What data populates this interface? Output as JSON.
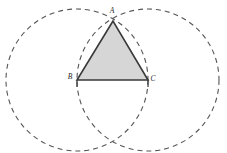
{
  "figure": {
    "type": "geometric-construction",
    "canvas": {
      "width": 227,
      "height": 153,
      "background": "#ffffff"
    },
    "style": {
      "triangle_fill": "#d6d6d6",
      "triangle_stroke": "#3a3a3a",
      "triangle_stroke_width": 1.6,
      "circle_stroke": "#555555",
      "circle_stroke_width": 1.1,
      "circle_dash": "5 4",
      "label_color": "#2b2b2b"
    },
    "points": [
      {
        "id": "A",
        "label": "A",
        "x": 113,
        "y": 21,
        "label_x": 112,
        "label_y": 13
      },
      {
        "id": "B",
        "label": "B",
        "x": 77,
        "y": 80,
        "label_x": 70,
        "label_y": 79
      },
      {
        "id": "C",
        "label": "C",
        "x": 148,
        "y": 80,
        "label_x": 153,
        "label_y": 81
      }
    ],
    "triangle": {
      "name": "triangle-ABC",
      "vertices": "113,21 77,80 148,80"
    },
    "circles": [
      {
        "id": "circle-B",
        "center": "B",
        "cx": 77,
        "cy": 80,
        "r": 71
      },
      {
        "id": "circle-C",
        "center": "C",
        "cx": 148,
        "cy": 80,
        "r": 71
      }
    ],
    "tick_marks": [
      {
        "id": "tick-B",
        "x1": 77,
        "y1": 80,
        "x2": 77,
        "y2": 87
      },
      {
        "id": "tick-C",
        "x1": 148,
        "y1": 80,
        "x2": 148,
        "y2": 87
      }
    ]
  }
}
